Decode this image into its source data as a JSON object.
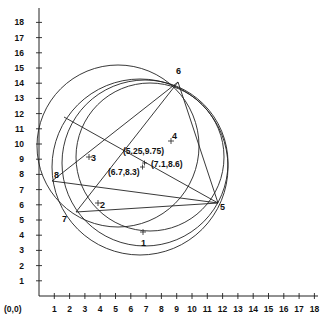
{
  "diagram": {
    "title": "",
    "origin_label": "(0,0)",
    "x_ticks": [
      "1",
      "2",
      "3",
      "4",
      "5",
      "6",
      "7",
      "8",
      "9",
      "10",
      "11",
      "12",
      "13",
      "14",
      "15",
      "16",
      "17",
      "18"
    ],
    "y_ticks": [
      "1",
      "2",
      "3",
      "4",
      "5",
      "6",
      "7",
      "8",
      "9",
      "10",
      "11",
      "12",
      "13",
      "14",
      "15",
      "16",
      "17",
      "18"
    ],
    "points": [
      {
        "id": "1",
        "label": "1",
        "x": 7.0,
        "y": 4.1
      },
      {
        "id": "2",
        "label": "2",
        "x": 3.8,
        "y": 6.0
      },
      {
        "id": "3",
        "label": "3",
        "x": 3.3,
        "y": 9.2
      },
      {
        "id": "4",
        "label": "4",
        "x": 8.9,
        "y": 10.1
      },
      {
        "id": "5",
        "label": "5",
        "x": 11.9,
        "y": 6.0
      },
      {
        "id": "6",
        "label": "6",
        "x": 9.3,
        "y": 14.0
      },
      {
        "id": "7",
        "label": "7",
        "x": 2.5,
        "y": 5.3
      },
      {
        "id": "8",
        "label": "8",
        "x": 0.9,
        "y": 7.4
      }
    ],
    "centers": [
      {
        "label": "(5.25,9.75)",
        "x": 5.25,
        "y": 9.75
      },
      {
        "label": "(6.7,8.3)",
        "x": 6.7,
        "y": 8.3
      },
      {
        "label": "(7.1,8.6)",
        "x": 7.1,
        "y": 8.6
      }
    ],
    "stroke_color": "#222222",
    "background_color": "#ffffff"
  }
}
